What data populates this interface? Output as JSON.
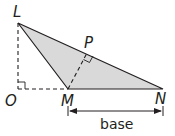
{
  "diagram": {
    "points": {
      "L": {
        "label": "L",
        "x": 18,
        "y": 23
      },
      "O": {
        "label": "O",
        "x": 18,
        "y": 89
      },
      "M": {
        "label": "M",
        "x": 68,
        "y": 89
      },
      "N": {
        "label": "N",
        "x": 163,
        "y": 89
      },
      "P": {
        "label": "P",
        "x": 87,
        "y": 51
      }
    },
    "base_label": "base",
    "colors": {
      "fill": "#d9d9d9",
      "stroke": "#231f20"
    }
  }
}
